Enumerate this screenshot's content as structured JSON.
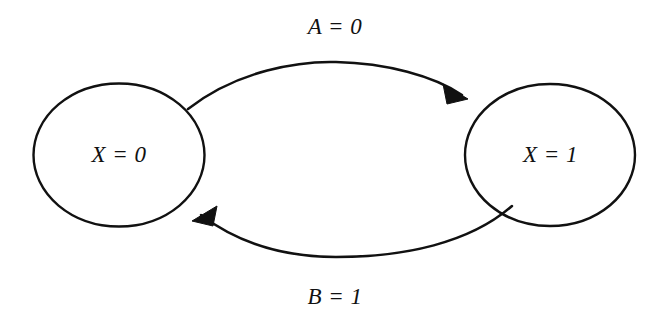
{
  "diagram": {
    "type": "state-transition-diagram",
    "title": "",
    "canvas": {
      "width": 669,
      "height": 325,
      "background": "#ffffff"
    },
    "stroke_color": "#111111",
    "text_color": "#111111",
    "states": [
      {
        "id": "state-0",
        "label": "X = 0",
        "shape": "ellipse",
        "cx": 119,
        "cy": 155,
        "rx": 86,
        "ry": 72
      },
      {
        "id": "state-1",
        "label": "X = 1",
        "shape": "ellipse",
        "cx": 550,
        "cy": 155,
        "rx": 85,
        "ry": 71
      }
    ],
    "transitions": [
      {
        "id": "edge-top",
        "label": "A = 0",
        "from": "state-0",
        "to": "state-1",
        "direction": "left-to-right",
        "curve": "arc-above",
        "arrowhead": "filled-triangle",
        "label_position": "above"
      },
      {
        "id": "edge-bottom",
        "label": "B = 1",
        "from": "state-1",
        "to": "state-0",
        "direction": "right-to-left",
        "curve": "arc-below",
        "arrowhead": "filled-triangle",
        "label_position": "below"
      }
    ]
  }
}
